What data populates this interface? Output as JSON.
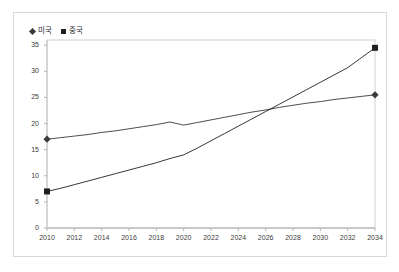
{
  "chart_data": {
    "type": "line",
    "title": "",
    "subtitle": "",
    "xlabel": "",
    "ylabel": "",
    "xlim": [
      2010,
      2034
    ],
    "ylim": [
      0,
      36
    ],
    "grid": false,
    "legend_position": "top-left",
    "x": [
      2010,
      2011,
      2012,
      2013,
      2014,
      2015,
      2016,
      2017,
      2018,
      2019,
      2020,
      2021,
      2022,
      2023,
      2024,
      2025,
      2026,
      2027,
      2028,
      2029,
      2030,
      2031,
      2032,
      2033,
      2034
    ],
    "series": [
      {
        "name": "미국",
        "marker": "diamond",
        "color": "#3a3a3a",
        "values": [
          17.0,
          17.3,
          17.6,
          17.9,
          18.3,
          18.6,
          19.0,
          19.4,
          19.8,
          20.3,
          19.7,
          20.2,
          20.7,
          21.2,
          21.7,
          22.2,
          22.6,
          23.1,
          23.5,
          23.9,
          24.2,
          24.6,
          24.9,
          25.2,
          25.5
        ]
      },
      {
        "name": "중국",
        "marker": "square",
        "color": "#1f1f1f",
        "values": [
          7.0,
          7.6,
          8.3,
          9.0,
          9.7,
          10.4,
          11.1,
          11.8,
          12.5,
          13.3,
          14.0,
          15.3,
          16.7,
          18.1,
          19.5,
          20.9,
          22.3,
          23.7,
          25.1,
          26.5,
          27.9,
          29.3,
          30.7,
          32.6,
          34.5
        ]
      }
    ],
    "yticks": [
      0,
      5,
      10,
      15,
      20,
      25,
      30,
      35
    ],
    "ytick_labels": [
      "0",
      "5",
      "10",
      "15",
      "20",
      "25",
      "30",
      "35"
    ],
    "xticks": [
      2010,
      2012,
      2014,
      2016,
      2018,
      2020,
      2022,
      2024,
      2026,
      2028,
      2030,
      2032,
      2034
    ],
    "xtick_labels": [
      "2010",
      "2012",
      "2014",
      "2016",
      "2018",
      "2020",
      "2022",
      "2024",
      "2026",
      "2028",
      "2030",
      "2032",
      "2034"
    ]
  },
  "legend": {
    "entries": [
      {
        "label": "미국",
        "marker": "diamond"
      },
      {
        "label": "중국",
        "marker": "square"
      }
    ]
  }
}
